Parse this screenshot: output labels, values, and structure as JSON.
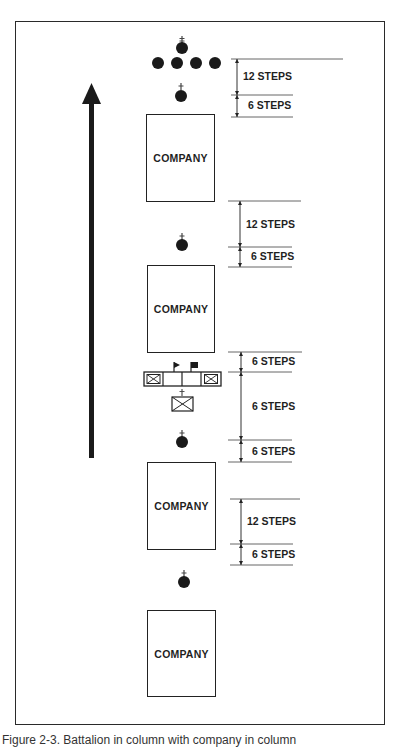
{
  "figure": {
    "caption": "Figure 2-3. Battalion in column with company in column",
    "direction_arrow": "up",
    "colors": {
      "ink": "#1a1a1a",
      "line": "#555555",
      "background": "#ffffff"
    }
  },
  "companies": [
    {
      "label": "COMPANY"
    },
    {
      "label": "COMPANY"
    },
    {
      "label": "COMPANY"
    },
    {
      "label": "COMPANY"
    }
  ],
  "intervals": [
    {
      "label": "12 STEPS"
    },
    {
      "label": "6 STEPS"
    },
    {
      "label": "12 STEPS"
    },
    {
      "label": "6 STEPS"
    },
    {
      "label": "6 STEPS"
    },
    {
      "label": "6 STEPS"
    },
    {
      "label": "6 STEPS"
    },
    {
      "label": "12 STEPS"
    },
    {
      "label": "6 STEPS"
    }
  ],
  "symbols": {
    "commander": "commander-circle-with-cross",
    "colors_bearer": "flag",
    "staff": "boxed-x"
  }
}
